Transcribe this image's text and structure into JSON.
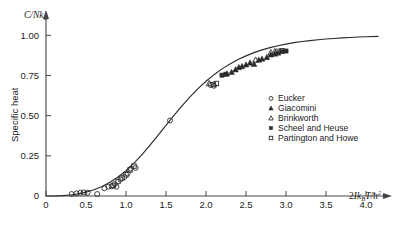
{
  "figure": {
    "background": "#ffffff",
    "ink": "#1a1a1a",
    "axis_color": "#444444",
    "curve_color": "#2b2b2b"
  },
  "chart_data": {
    "type": "scatter",
    "title": "",
    "subtitle": "",
    "xlabel": "2Ik_BT/h-bar^2",
    "xlabel_parts": {
      "lead": "2",
      "italic_main": "Ik",
      "sub": "B",
      "italic_t": "T",
      "slash": "/",
      "hbar": "ħ",
      "sup": "2"
    },
    "ylabel": "Specific heat",
    "y_axis_title": "C/Nk_B",
    "y_axis_title_parts": {
      "main": "C/Nk",
      "sub": "B"
    },
    "xlim": [
      0,
      4.25
    ],
    "ylim": [
      0,
      1.12
    ],
    "xticks": [
      0,
      0.5,
      1.0,
      1.5,
      2.0,
      2.5,
      3.0,
      3.5,
      4.0
    ],
    "xticklabels": [
      "0",
      "0.5",
      "1.0",
      "1.5",
      "2.0",
      "2.5",
      "3.0",
      "3.5",
      "4.0"
    ],
    "yticks": [
      0,
      0.25,
      0.5,
      0.75,
      1.0
    ],
    "yticklabels": [
      "0",
      "0.25",
      "0.50",
      "0.75",
      "1.00"
    ],
    "grid": false,
    "legend_position": "center-right",
    "curve": {
      "name": "theoretical rotational specific heat",
      "x": [
        0.0,
        0.1,
        0.2,
        0.3,
        0.4,
        0.5,
        0.6,
        0.7,
        0.8,
        0.9,
        1.0,
        1.1,
        1.2,
        1.3,
        1.4,
        1.5,
        1.6,
        1.7,
        1.8,
        1.9,
        2.0,
        2.1,
        2.2,
        2.3,
        2.4,
        2.5,
        2.6,
        2.7,
        2.8,
        2.9,
        3.0,
        3.1,
        3.2,
        3.3,
        3.4,
        3.5,
        3.6,
        3.7,
        3.8,
        3.9,
        4.0,
        4.15
      ],
      "y": [
        0.0,
        0.0,
        0.002,
        0.006,
        0.013,
        0.024,
        0.039,
        0.059,
        0.085,
        0.118,
        0.158,
        0.205,
        0.258,
        0.316,
        0.377,
        0.44,
        0.502,
        0.561,
        0.617,
        0.668,
        0.714,
        0.755,
        0.791,
        0.822,
        0.849,
        0.872,
        0.892,
        0.909,
        0.923,
        0.935,
        0.945,
        0.954,
        0.961,
        0.967,
        0.972,
        0.977,
        0.98,
        0.984,
        0.986,
        0.989,
        0.991,
        0.993
      ]
    },
    "series": [
      {
        "name": "Eucker",
        "marker": "open-circle",
        "fill": "none",
        "color": "#2b2b2b",
        "points": [
          [
            0.32,
            0.012
          ],
          [
            0.38,
            0.016
          ],
          [
            0.43,
            0.02
          ],
          [
            0.47,
            0.022
          ],
          [
            0.52,
            0.021
          ],
          [
            0.64,
            0.012
          ],
          [
            0.73,
            0.048
          ],
          [
            0.78,
            0.058
          ],
          [
            0.82,
            0.06
          ],
          [
            0.86,
            0.074
          ],
          [
            0.88,
            0.058
          ],
          [
            0.93,
            0.102
          ],
          [
            0.98,
            0.118
          ],
          [
            1.02,
            0.14
          ],
          [
            1.06,
            0.17
          ],
          [
            1.12,
            0.175
          ],
          [
            1.55,
            0.47
          ],
          [
            2.06,
            0.69
          ],
          [
            2.1,
            0.686
          ]
        ]
      },
      {
        "name": "Giacomini",
        "marker": "filled-triangle",
        "fill": "#2b2b2b",
        "color": "#2b2b2b",
        "points": [
          [
            2.26,
            0.76
          ],
          [
            2.32,
            0.77
          ],
          [
            2.37,
            0.786
          ],
          [
            2.41,
            0.8
          ],
          [
            2.45,
            0.806
          ],
          [
            2.5,
            0.816
          ],
          [
            2.55,
            0.828
          ],
          [
            2.6,
            0.82
          ],
          [
            2.66,
            0.846
          ],
          [
            2.7,
            0.852
          ],
          [
            2.76,
            0.862
          ],
          [
            2.81,
            0.878
          ],
          [
            2.86,
            0.884
          ],
          [
            2.9,
            0.89
          ]
        ]
      },
      {
        "name": "Brinkworth",
        "marker": "open-triangle",
        "fill": "none",
        "color": "#2b2b2b",
        "points": [
          [
            2.04,
            0.7
          ],
          [
            2.62,
            0.846
          ],
          [
            2.81,
            0.892
          ],
          [
            2.86,
            0.898
          ]
        ]
      },
      {
        "name": "Scheel and Heuse",
        "marker": "filled-square",
        "fill": "#2b2b2b",
        "color": "#2b2b2b",
        "points": [
          [
            2.2,
            0.752
          ],
          [
            2.25,
            0.758
          ],
          [
            2.95,
            0.898
          ],
          [
            3.0,
            0.902
          ]
        ]
      },
      {
        "name": "Partington and Howe",
        "marker": "open-square",
        "fill": "none",
        "color": "#2b2b2b",
        "points": [
          [
            0.84,
            0.066
          ],
          [
            0.9,
            0.09
          ],
          [
            0.95,
            0.112
          ],
          [
            1.0,
            0.132
          ],
          [
            1.05,
            0.162
          ],
          [
            1.1,
            0.186
          ],
          [
            2.09,
            0.694
          ],
          [
            2.13,
            0.7
          ],
          [
            2.9,
            0.9
          ],
          [
            2.95,
            0.904
          ]
        ]
      }
    ],
    "legend_entries": [
      {
        "label": "Eucker",
        "marker": "open-circle"
      },
      {
        "label": "Giacomini",
        "marker": "filled-triangle"
      },
      {
        "label": "Brinkworth",
        "marker": "open-triangle"
      },
      {
        "label": "Scheel and Heuse",
        "marker": "filled-square"
      },
      {
        "label": "Partington and Howe",
        "marker": "open-square"
      }
    ]
  }
}
